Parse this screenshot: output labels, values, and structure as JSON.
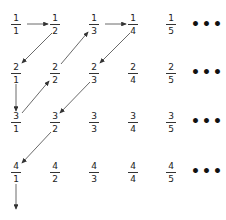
{
  "diagram": {
    "title": "",
    "rows": [
      [
        {
          "num": "1",
          "den": "1"
        },
        {
          "num": "1",
          "den": "2"
        },
        {
          "num": "1",
          "den": "3"
        },
        {
          "num": "1",
          "den": "4"
        },
        {
          "num": "1",
          "den": "5"
        }
      ],
      [
        {
          "num": "2",
          "den": "1"
        },
        {
          "num": "2",
          "den": "2"
        },
        {
          "num": "2",
          "den": "3"
        },
        {
          "num": "2",
          "den": "4"
        },
        {
          "num": "2",
          "den": "5"
        }
      ],
      [
        {
          "num": "3",
          "den": "1"
        },
        {
          "num": "3",
          "den": "2"
        },
        {
          "num": "3",
          "den": "3"
        },
        {
          "num": "3",
          "den": "4"
        },
        {
          "num": "3",
          "den": "5"
        }
      ],
      [
        {
          "num": "4",
          "den": "1"
        },
        {
          "num": "4",
          "den": "2"
        },
        {
          "num": "4",
          "den": "3"
        },
        {
          "num": "4",
          "den": "4"
        },
        {
          "num": "4",
          "den": "5"
        }
      ]
    ],
    "ellipsis": "•••",
    "path": [
      {
        "from": "1/1",
        "to": "1/2",
        "direction": "right"
      },
      {
        "from": "1/2",
        "to": "2/1",
        "direction": "down-left"
      },
      {
        "from": "2/1",
        "to": "3/1",
        "direction": "down"
      },
      {
        "from": "3/1",
        "to": "2/2",
        "direction": "up-right"
      },
      {
        "from": "2/2",
        "to": "1/3",
        "direction": "up-right"
      },
      {
        "from": "1/3",
        "to": "1/4",
        "direction": "right"
      },
      {
        "from": "1/4",
        "to": "2/3",
        "direction": "down-left"
      },
      {
        "from": "2/3",
        "to": "3/2",
        "direction": "down-left"
      },
      {
        "from": "3/2",
        "to": "4/1",
        "direction": "down-left"
      },
      {
        "from": "4/1",
        "to": "continues",
        "direction": "down"
      }
    ],
    "colors": {
      "arrow": "#333333",
      "text": "#222222"
    }
  }
}
